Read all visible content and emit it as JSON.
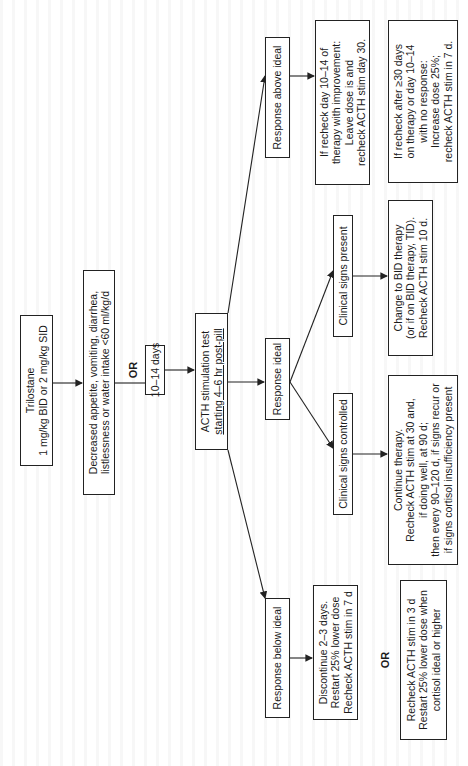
{
  "flowchart": {
    "title_box": {
      "lines": [
        "Trilostane",
        "1 mg/kg BID or 2 mg/kg SID"
      ]
    },
    "trigger_box": {
      "lines": [
        "Decreased appetite, vomiting, diarrhea,",
        "listlessness or water intake <60 ml/kg/d"
      ]
    },
    "or_label_1": "OR",
    "timing_box": {
      "lines": [
        "10–14 days"
      ]
    },
    "acth_box": {
      "lines": [
        "ACTH stimulation test",
        "starting 4–6 hr post-pill"
      ]
    },
    "responses": {
      "above": {
        "label": "Response above ideal"
      },
      "ideal": {
        "label": "Response ideal"
      },
      "below": {
        "label": "Response below ideal"
      }
    },
    "above_outcomes": {
      "improvement": {
        "lines": [
          "If recheck day 10–14 of",
          "therapy with improvement:",
          "Leave dose is and",
          "recheck ACTH stim day 30."
        ]
      },
      "no_response": {
        "lines": [
          "If recheck after ≥30 days",
          "on therapy or day 10–14",
          "with no response:",
          "Increase dose 25%;",
          "recheck ACTH stim in 7 d."
        ]
      }
    },
    "ideal_branches": {
      "signs_present": {
        "label": "Clinical signs present",
        "action_lines": [
          "Change to BID therapy",
          "(or if on BID therapy, TID).",
          "Recheck ACTH stim 10 d."
        ]
      },
      "signs_controlled": {
        "label": "Clinical signs controlled",
        "action_lines": [
          "Continue therapy.",
          "Recheck ACTH stim at 30 and,",
          "if doing well, at 90 d;",
          "then every 90–120 d, if signs recur or",
          "if signs cortisol insufficiency present"
        ]
      }
    },
    "below_outcomes": {
      "discontinue": {
        "lines": [
          "Discontinue 2–3 days.",
          "Restart 25% lower dose",
          "Recheck ACTH stim in 7 d"
        ]
      },
      "or_label_2": "OR",
      "recheck": {
        "lines": [
          "Recheck ACTH stim in 3 d",
          "Restart 25% lower dose when",
          "cortisol ideal or higher"
        ]
      }
    },
    "colors": {
      "line": "#222222",
      "box_border": "#222222",
      "background": "#ffffff"
    },
    "orientation": "rotated 90° counter-clockwise"
  }
}
